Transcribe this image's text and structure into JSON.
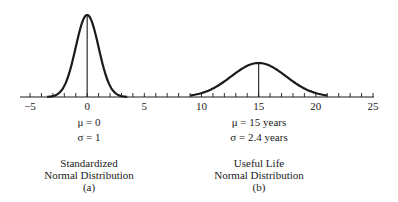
{
  "chart_data": {
    "type": "line",
    "title": "",
    "xlabel": "",
    "ylabel": "",
    "axis": {
      "xmin": -5,
      "xmax": 25,
      "ticks": [
        -5,
        0,
        5,
        10,
        15,
        20,
        25
      ],
      "minor_tick_step": 1,
      "grid": false
    },
    "series": [
      {
        "name": "Standardized Normal Distribution",
        "mean": 0,
        "sd": 1,
        "x_range": [
          -3.5,
          3.5
        ],
        "peak_marker": true
      },
      {
        "name": "Useful Life Normal Distribution",
        "mean": 15,
        "sd": 2.4,
        "x_range": [
          9,
          21
        ],
        "peak_marker": true
      }
    ],
    "annotations": [
      {
        "panel": "a",
        "mu": "μ = 0",
        "sigma": "σ = 1",
        "caption": [
          "Standardized",
          "Normal Distribution",
          "(a)"
        ]
      },
      {
        "panel": "b",
        "mu": "μ = 15 years",
        "sigma": "σ = 2.4 years",
        "caption": [
          "Useful Life",
          "Normal Distribution",
          "(b)"
        ]
      }
    ]
  },
  "panel_a": {
    "mu": "μ = 0",
    "sigma": "σ = 1",
    "caption_line1": "Standardized",
    "caption_line2": "Normal Distribution",
    "caption_line3": "(a)"
  },
  "panel_b": {
    "mu": "μ = 15 years",
    "sigma": "σ = 2.4 years",
    "caption_line1": "Useful Life",
    "caption_line2": "Normal Distribution",
    "caption_line3": "(b)"
  },
  "tick_labels": [
    "−5",
    "0",
    "5",
    "10",
    "15",
    "20",
    "25"
  ]
}
